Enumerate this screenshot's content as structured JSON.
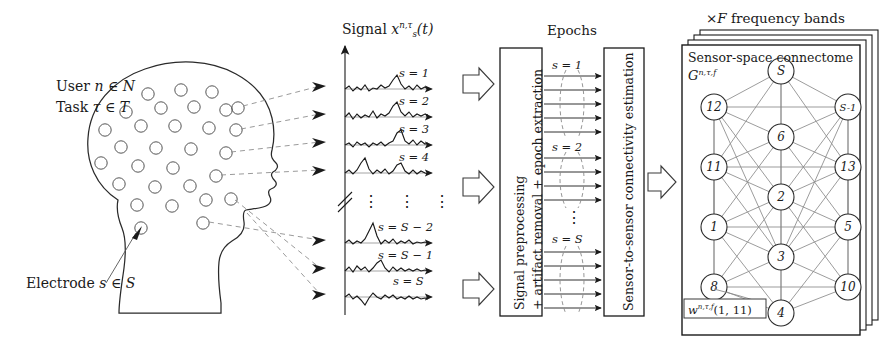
{
  "figure": {
    "head": {
      "user_label": "User n ∈ Ν",
      "user_prefix": "User",
      "user_var": "n",
      "user_set": "N",
      "task_prefix": "Task",
      "task_var": "τ",
      "task_set": "T",
      "electrode_prefix": "Electrode",
      "electrode_var": "s",
      "electrode_set": "S",
      "electrode_count": 30
    },
    "signals": {
      "title_prefix": "Signal",
      "title_var": "x",
      "title_sub": "s",
      "title_sup": "n,τ",
      "title_arg": "(t)",
      "labels": [
        "s = 1",
        "s = 2",
        "s = 3",
        "s = 4",
        "s = S − 2",
        "s = S − 1",
        "s = S"
      ],
      "ellipsis": "⋮",
      "axis_break": "//"
    },
    "epochs": {
      "title": "Epochs",
      "group_labels": [
        "s = 1",
        "s = 2",
        "s = S"
      ],
      "arrows_per_group": 5,
      "ellipsis": "⋮"
    },
    "boxes": [
      {
        "name": "preprocessing",
        "line1": "Signal preprocessing",
        "line2": "+ artifact removal + epoch extraction"
      },
      {
        "name": "connectivity",
        "line1": "Sensor-to-sensor connectivity estimation"
      }
    ],
    "connectome": {
      "stack_title_prefix": "×",
      "stack_title_var": "F",
      "stack_title_suffix": "frequency bands",
      "panel_title": "Sensor-space connectome",
      "graph_symbol": "G",
      "graph_sup": "n,τ,f",
      "weight_symbol": "w",
      "weight_sup": "n,τ,f",
      "weight_arg": "(1, 11)",
      "layers": 4,
      "nodes": [
        {
          "id": "S",
          "label": "S",
          "x": 99,
          "y": 26
        },
        {
          "id": "12",
          "label": "12",
          "x": 32,
          "y": 62
        },
        {
          "id": "S-1",
          "label": "S-1",
          "x": 166,
          "y": 62
        },
        {
          "id": "6",
          "label": "6",
          "x": 99,
          "y": 92
        },
        {
          "id": "11",
          "label": "11",
          "x": 32,
          "y": 122
        },
        {
          "id": "13",
          "label": "13",
          "x": 166,
          "y": 122
        },
        {
          "id": "2",
          "label": "2",
          "x": 99,
          "y": 152
        },
        {
          "id": "1",
          "label": "1",
          "x": 32,
          "y": 182
        },
        {
          "id": "5",
          "label": "5",
          "x": 166,
          "y": 182
        },
        {
          "id": "3",
          "label": "3",
          "x": 99,
          "y": 212
        },
        {
          "id": "8",
          "label": "8",
          "x": 32,
          "y": 242
        },
        {
          "id": "10",
          "label": "10",
          "x": 166,
          "y": 242
        },
        {
          "id": "4",
          "label": "4",
          "x": 99,
          "y": 268
        }
      ],
      "edges": [
        [
          "S",
          "12"
        ],
        [
          "S",
          "S-1"
        ],
        [
          "S",
          "6"
        ],
        [
          "S",
          "11"
        ],
        [
          "S",
          "13"
        ],
        [
          "S",
          "2"
        ],
        [
          "12",
          "S-1"
        ],
        [
          "12",
          "6"
        ],
        [
          "12",
          "11"
        ],
        [
          "12",
          "2"
        ],
        [
          "12",
          "1"
        ],
        [
          "12",
          "3"
        ],
        [
          "S-1",
          "6"
        ],
        [
          "S-1",
          "13"
        ],
        [
          "S-1",
          "2"
        ],
        [
          "S-1",
          "5"
        ],
        [
          "S-1",
          "3"
        ],
        [
          "6",
          "11"
        ],
        [
          "6",
          "13"
        ],
        [
          "6",
          "2"
        ],
        [
          "6",
          "1"
        ],
        [
          "6",
          "5"
        ],
        [
          "11",
          "13"
        ],
        [
          "11",
          "2"
        ],
        [
          "11",
          "1"
        ],
        [
          "11",
          "3"
        ],
        [
          "11",
          "8"
        ],
        [
          "13",
          "2"
        ],
        [
          "13",
          "5"
        ],
        [
          "13",
          "3"
        ],
        [
          "13",
          "10"
        ],
        [
          "2",
          "1"
        ],
        [
          "2",
          "5"
        ],
        [
          "2",
          "3"
        ],
        [
          "2",
          "8"
        ],
        [
          "2",
          "10"
        ],
        [
          "2",
          "4"
        ],
        [
          "1",
          "5"
        ],
        [
          "1",
          "3"
        ],
        [
          "1",
          "8"
        ],
        [
          "1",
          "4"
        ],
        [
          "5",
          "3"
        ],
        [
          "5",
          "10"
        ],
        [
          "5",
          "4"
        ],
        [
          "3",
          "8"
        ],
        [
          "3",
          "10"
        ],
        [
          "3",
          "4"
        ],
        [
          "8",
          "10"
        ],
        [
          "8",
          "4"
        ],
        [
          "10",
          "4"
        ]
      ]
    },
    "colors": {
      "ink": "#1a1a1a",
      "line": "#3a3a3a",
      "light_line": "#808080",
      "dashed": "#8a8a8a",
      "paper": "#ffffff"
    }
  }
}
